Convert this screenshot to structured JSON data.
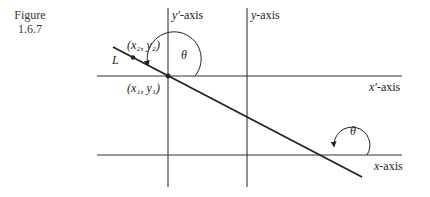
{
  "figure": {
    "caption_line1": "Figure",
    "caption_line2": "1.6.7"
  },
  "labels": {
    "y_prime_axis_var": "y′",
    "y_prime_axis_suffix": "-axis",
    "y_axis_var": "y",
    "y_axis_suffix": "-axis",
    "x_prime_axis_var": "x′",
    "x_prime_axis_suffix": "-axis",
    "x_axis_var": "x",
    "x_axis_suffix": "-axis",
    "line_name": "L",
    "point2": "(x₂, y₂)",
    "point1": "(x₁, y₁)",
    "angle_top": "θ",
    "angle_bottom": "θ"
  },
  "colors": {
    "stroke": "#222222",
    "axis_stroke": "#333333",
    "background": "#ffffff"
  }
}
